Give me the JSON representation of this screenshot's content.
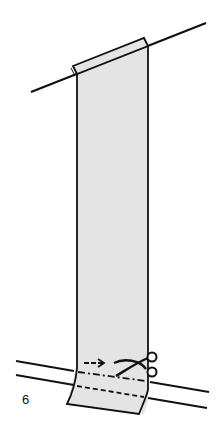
{
  "figure": {
    "step_number": "6",
    "icons": [
      "scissors-icon",
      "arrow-right-icon"
    ],
    "colors": {
      "line": "#111111",
      "strip_fill": "#e4e4e4",
      "background": "#ffffff"
    }
  }
}
